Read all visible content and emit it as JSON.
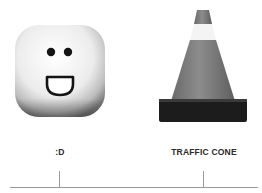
{
  "items": [
    {
      "id": "face",
      "label": ":D",
      "image": "white-rounded-block-with-smiling-face-icon",
      "tick_x": 59
    },
    {
      "id": "cone",
      "label": "TRAFFIC CONE",
      "image": "traffic-cone-icon",
      "tick_x": 203
    }
  ],
  "colors": {
    "background": "#ffffff",
    "label": "#2a2a2a",
    "axis": "#9a9a9a",
    "cone_body": "#7a7a7a",
    "cone_stripe": "#f4f4f4",
    "cone_base": "#1c1c1c",
    "face_block": "#f2f2f2",
    "face_features": "#141414"
  }
}
